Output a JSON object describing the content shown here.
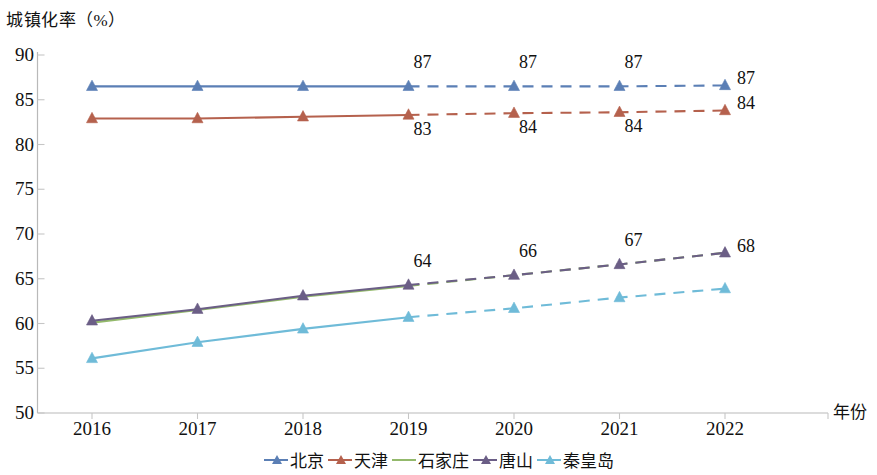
{
  "chart_data": {
    "type": "line",
    "title": "",
    "ylabel": "城镇化率（%）",
    "xlabel": "年份",
    "ylim": [
      50,
      90
    ],
    "ytick_labels": [
      "90",
      "85",
      "80",
      "75",
      "70",
      "65",
      "60",
      "55",
      "50"
    ],
    "ytick_values": [
      90,
      85,
      80,
      75,
      70,
      65,
      60,
      55,
      50
    ],
    "categories": [
      "2016",
      "2017",
      "2018",
      "2019",
      "2020",
      "2021",
      "2022"
    ],
    "x": [
      2016,
      2017,
      2018,
      2019,
      2020,
      2021,
      2022
    ],
    "grid": false,
    "legend_position": "bottom",
    "solid_until_index": 3,
    "series": [
      {
        "name": "北京",
        "color": "#5B7FB5",
        "values": [
          86.5,
          86.5,
          86.5,
          86.5,
          86.5,
          86.5,
          86.6
        ],
        "labels": [
          "",
          "",
          "",
          "87",
          "87",
          "87",
          "87"
        ]
      },
      {
        "name": "天津",
        "color": "#B5614D",
        "values": [
          82.9,
          82.9,
          83.1,
          83.3,
          83.5,
          83.6,
          83.8
        ],
        "labels": [
          "",
          "",
          "",
          "83",
          "84",
          "84",
          "84"
        ]
      },
      {
        "name": "石家庄",
        "color": "#93B96B",
        "values": [
          60.1,
          61.5,
          63.0,
          64.2,
          65.4,
          66.6,
          67.9
        ],
        "labels": [
          "",
          "",
          "",
          "",
          "",
          "",
          ""
        ]
      },
      {
        "name": "唐山",
        "color": "#6B5E86",
        "values": [
          60.3,
          61.6,
          63.1,
          64.3,
          65.4,
          66.6,
          67.9
        ],
        "labels": [
          "",
          "",
          "",
          "64",
          "66",
          "67",
          "68"
        ]
      },
      {
        "name": "秦皇岛",
        "color": "#6FBBD8",
        "values": [
          56.1,
          57.9,
          59.4,
          60.7,
          61.7,
          62.9,
          63.9
        ],
        "labels": [
          "",
          "",
          "",
          "",
          "",
          "",
          ""
        ]
      }
    ],
    "annotations": [
      {
        "series": "北京",
        "x": "2019",
        "text": "87",
        "position": "above"
      },
      {
        "series": "北京",
        "x": "2020",
        "text": "87",
        "position": "above"
      },
      {
        "series": "北京",
        "x": "2021",
        "text": "87",
        "position": "above"
      },
      {
        "series": "北京",
        "x": "2022",
        "text": "87",
        "position": "right"
      },
      {
        "series": "天津",
        "x": "2019",
        "text": "83",
        "position": "below"
      },
      {
        "series": "天津",
        "x": "2020",
        "text": "84",
        "position": "below"
      },
      {
        "series": "天津",
        "x": "2021",
        "text": "84",
        "position": "below"
      },
      {
        "series": "天津",
        "x": "2022",
        "text": "84",
        "position": "right"
      },
      {
        "series": "唐山",
        "x": "2019",
        "text": "64",
        "position": "above"
      },
      {
        "series": "唐山",
        "x": "2020",
        "text": "66",
        "position": "above"
      },
      {
        "series": "唐山",
        "x": "2021",
        "text": "67",
        "position": "above"
      },
      {
        "series": "唐山",
        "x": "2022",
        "text": "68",
        "position": "right"
      }
    ]
  },
  "legend": {
    "items": [
      {
        "label": "北京",
        "color": "#5B7FB5"
      },
      {
        "label": "天津",
        "color": "#B5614D"
      },
      {
        "label": "石家庄",
        "color": "#93B96B"
      },
      {
        "label": "唐山",
        "color": "#6B5E86"
      },
      {
        "label": "秦皇岛",
        "color": "#6FBBD8"
      }
    ]
  }
}
